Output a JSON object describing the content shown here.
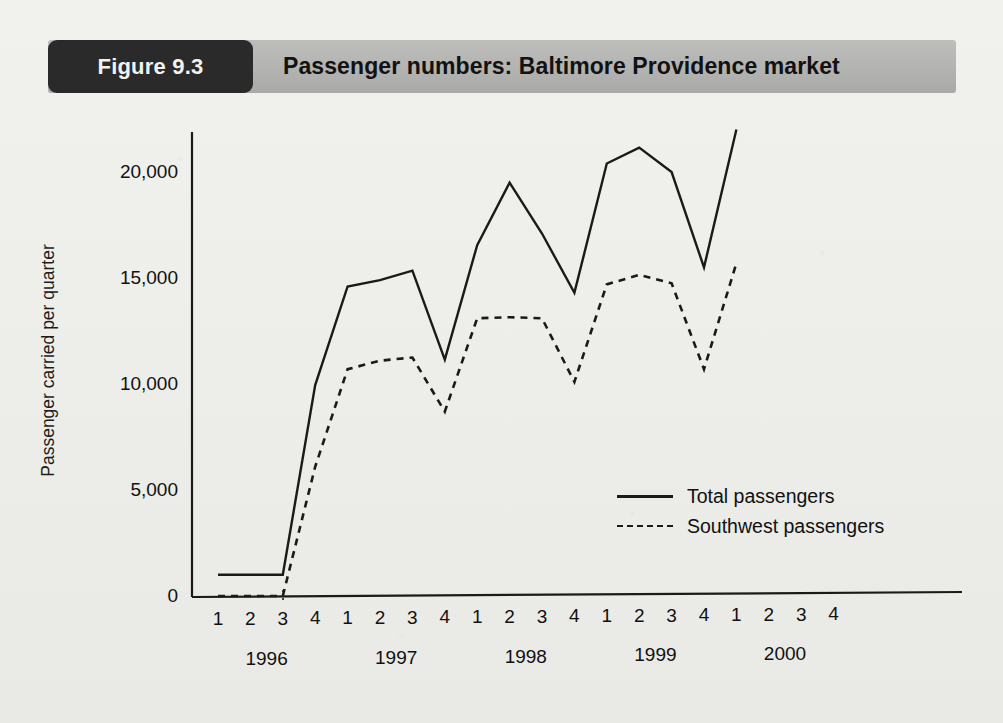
{
  "figure": {
    "tag": "Figure 9.3",
    "title": "Passenger numbers: Baltimore Providence market"
  },
  "colors": {
    "banner_bg": "#b3b3b1",
    "tag_bg": "#2a2a2a",
    "tag_text": "#f2f2f2",
    "page_bg": "#efefec",
    "ink": "#1a1a1a"
  },
  "legend": {
    "position": "inside-right",
    "entries": [
      {
        "label": "Total passengers",
        "style": "solid"
      },
      {
        "label": "Southwest passengers",
        "style": "dashed"
      }
    ]
  },
  "axes": {
    "ylabel": "Passenger carried per quarter",
    "yticks": [
      "0",
      "5,000",
      "10,000",
      "15,000",
      "20,000"
    ],
    "quarter_labels": [
      "1",
      "2",
      "3",
      "4",
      "1",
      "2",
      "3",
      "4",
      "1",
      "2",
      "3",
      "4",
      "1",
      "2",
      "3",
      "4",
      "1",
      "2",
      "3",
      "4"
    ],
    "year_labels": [
      "1996",
      "1997",
      "1998",
      "1999",
      "2000"
    ]
  },
  "chart_data": {
    "type": "line",
    "title": "Passenger numbers: Baltimore Providence market",
    "xlabel": "",
    "ylabel": "Passenger carried per quarter",
    "ylim": [
      0,
      22500
    ],
    "yticks": [
      0,
      5000,
      10000,
      15000,
      20000
    ],
    "grid": false,
    "legend_position": "inside-right",
    "categories": [
      "1996 Q1",
      "1996 Q2",
      "1996 Q3",
      "1996 Q4",
      "1997 Q1",
      "1997 Q2",
      "1997 Q3",
      "1997 Q4",
      "1998 Q1",
      "1998 Q2",
      "1998 Q3",
      "1998 Q4",
      "1999 Q1",
      "1999 Q2",
      "1999 Q3",
      "1999 Q4",
      "2000 Q1",
      "2000 Q2",
      "2000 Q3",
      "2000 Q4"
    ],
    "series": [
      {
        "name": "Total passengers",
        "style": "solid",
        "values": [
          1000,
          1000,
          1000,
          9950,
          14600,
          14900,
          15350,
          11150,
          16550,
          19500,
          17100,
          14300,
          20400,
          21150,
          20000,
          15500,
          22000,
          null,
          null,
          null
        ]
      },
      {
        "name": "Southwest passengers",
        "style": "dashed",
        "values": [
          0,
          0,
          0,
          6100,
          10700,
          11100,
          11250,
          8700,
          13100,
          13150,
          13100,
          10100,
          14700,
          15150,
          14750,
          10700,
          15700,
          null,
          null,
          null
        ]
      }
    ]
  }
}
